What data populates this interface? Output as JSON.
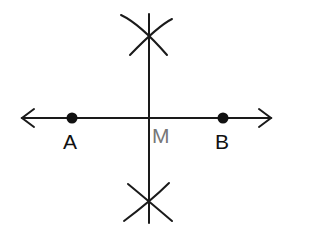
{
  "diagram": {
    "type": "perpendicular bisector construction",
    "points": [
      {
        "label": "A",
        "x": 72,
        "y": 118,
        "color": "#111111"
      },
      {
        "label": "B",
        "x": 223,
        "y": 118,
        "color": "#111111"
      },
      {
        "label": "M",
        "x": 149,
        "y": 118,
        "color": "#777777"
      }
    ],
    "line_color": "#1a1a1a"
  }
}
